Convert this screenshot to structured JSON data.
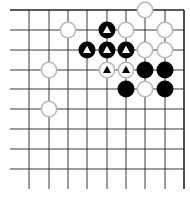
{
  "diagram": {
    "type": "go-board-corner",
    "grid": {
      "x_lines": [
        29,
        49,
        68,
        87,
        107,
        126,
        145,
        165,
        184
      ],
      "y_lines": [
        10,
        30,
        50,
        70,
        89,
        109,
        129,
        149,
        169
      ],
      "h_line_start_x": 10,
      "h_line_end_x": 184,
      "v_line_start_y": 10,
      "v_line_end_y": 189,
      "top_edge": true,
      "right_edge": true
    },
    "colors": {
      "line": "#222222",
      "black_stone": "#000000",
      "white_stone": "#ffffff",
      "white_stone_border": "#b8b8b8",
      "marker_on_black": "#ffffff",
      "marker_on_white": "#000000"
    },
    "stone_radius": 8.5,
    "stones": [
      {
        "color": "white",
        "x": 145,
        "y": 10,
        "marker": null
      },
      {
        "color": "white",
        "x": 68,
        "y": 30,
        "marker": null
      },
      {
        "color": "black",
        "x": 107,
        "y": 30,
        "marker": "triangle"
      },
      {
        "color": "white",
        "x": 126,
        "y": 30,
        "marker": null
      },
      {
        "color": "white",
        "x": 165,
        "y": 30,
        "marker": null
      },
      {
        "color": "black",
        "x": 87,
        "y": 50,
        "marker": "triangle"
      },
      {
        "color": "black",
        "x": 107,
        "y": 50,
        "marker": "triangle"
      },
      {
        "color": "black",
        "x": 126,
        "y": 50,
        "marker": "triangle"
      },
      {
        "color": "white",
        "x": 145,
        "y": 50,
        "marker": null
      },
      {
        "color": "white",
        "x": 165,
        "y": 50,
        "marker": null
      },
      {
        "color": "white",
        "x": 49,
        "y": 70,
        "marker": null
      },
      {
        "color": "white",
        "x": 107,
        "y": 70,
        "marker": "triangle"
      },
      {
        "color": "white",
        "x": 126,
        "y": 70,
        "marker": "triangle"
      },
      {
        "color": "black",
        "x": 145,
        "y": 70,
        "marker": null
      },
      {
        "color": "black",
        "x": 165,
        "y": 70,
        "marker": null
      },
      {
        "color": "black",
        "x": 126,
        "y": 89,
        "marker": null
      },
      {
        "color": "white",
        "x": 145,
        "y": 89,
        "marker": null
      },
      {
        "color": "black",
        "x": 165,
        "y": 89,
        "marker": null
      },
      {
        "color": "white",
        "x": 49,
        "y": 109,
        "marker": null
      }
    ]
  }
}
